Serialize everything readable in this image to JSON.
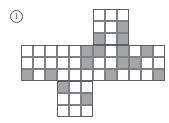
{
  "figure": {
    "label": "1",
    "label_name": "figure-number-circled",
    "type": "cube-net-grid-puzzle",
    "colors": {
      "shaded_fill": "#a3a5a8",
      "empty_fill": "#ffffff",
      "grid_line": "#7d8085",
      "outline": "#5d6064",
      "label_text": "#3a3d41"
    },
    "geometry": {
      "cell_size": 12,
      "origin_x": 21,
      "origin_y": 9
    },
    "blocks": [
      {
        "name": "top-arm",
        "col_offset": 6,
        "row_offset": 0,
        "cols": 3,
        "rows": 3,
        "shaded": [
          [
            0,
            0,
            0
          ],
          [
            0,
            0,
            1
          ],
          [
            1,
            0,
            1
          ]
        ]
      },
      {
        "name": "middle-band",
        "col_offset": 0,
        "row_offset": 3,
        "cols": 12,
        "rows": 3,
        "shaded": [
          [
            0,
            0,
            0,
            0,
            0,
            1,
            1,
            0,
            1,
            0,
            1,
            0
          ],
          [
            0,
            0,
            0,
            0,
            0,
            1,
            0,
            0,
            1,
            1,
            0,
            0
          ],
          [
            1,
            0,
            1,
            0,
            0,
            0,
            0,
            1,
            0,
            0,
            0,
            1
          ]
        ]
      },
      {
        "name": "bottom-arm",
        "col_offset": 3,
        "row_offset": 6,
        "cols": 3,
        "rows": 3,
        "shaded": [
          [
            1,
            0,
            0
          ],
          [
            0,
            0,
            1
          ],
          [
            0,
            0,
            0
          ]
        ]
      }
    ]
  }
}
